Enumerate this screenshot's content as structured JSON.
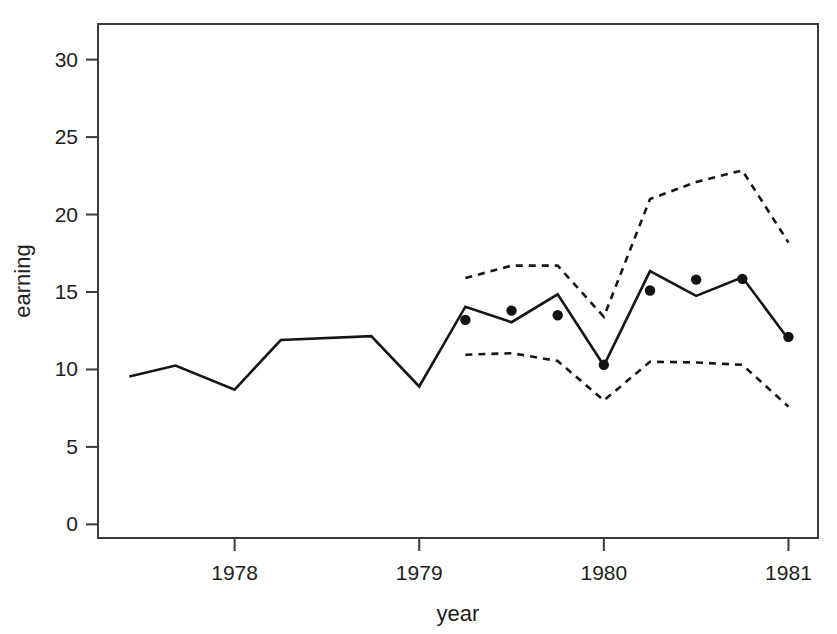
{
  "chart_data": {
    "type": "line",
    "title": "",
    "xlabel": "year",
    "ylabel": "earning",
    "xlim": [
      1977.26,
      1981.16
    ],
    "ylim": [
      -0.88,
      32.3
    ],
    "xticks": [
      1978,
      1979,
      1980,
      1981
    ],
    "xtick_labels": [
      "1978",
      "1979",
      "1980",
      "1981"
    ],
    "yticks": [
      0,
      5,
      10,
      15,
      20,
      25,
      30
    ],
    "ytick_labels": [
      "0",
      "5",
      "10",
      "15",
      "20",
      "25",
      "30"
    ],
    "grid": false,
    "legend": "none",
    "box": true,
    "series": [
      {
        "name": "fitted",
        "style": "solid-line",
        "x": [
          1977.43,
          1977.68,
          1978.0,
          1978.25,
          1978.74,
          1979.0,
          1979.25,
          1979.5,
          1979.75,
          1980.0,
          1980.25,
          1980.5,
          1980.75,
          1981.0
        ],
        "values": [
          9.55,
          10.25,
          8.7,
          11.9,
          12.15,
          8.9,
          14.05,
          13.05,
          14.85,
          10.25,
          16.35,
          14.75,
          15.95,
          11.95
        ]
      },
      {
        "name": "upper-bound",
        "style": "dashed-line",
        "x": [
          1979.25,
          1979.5,
          1979.75,
          1980.0,
          1980.25,
          1980.5,
          1980.75,
          1981.0
        ],
        "values": [
          15.9,
          16.7,
          16.7,
          13.4,
          21.0,
          22.1,
          22.85,
          18.2
        ]
      },
      {
        "name": "lower-bound",
        "style": "dashed-line",
        "x": [
          1979.25,
          1979.5,
          1979.75,
          1980.0,
          1980.25,
          1980.5,
          1980.75,
          1981.0
        ],
        "values": [
          10.95,
          11.05,
          10.55,
          8.0,
          10.5,
          10.45,
          10.3,
          7.6
        ]
      },
      {
        "name": "observed",
        "style": "points",
        "x": [
          1979.25,
          1979.5,
          1979.75,
          1980.0,
          1980.25,
          1980.5,
          1980.75,
          1981.0
        ],
        "values": [
          13.2,
          13.8,
          13.5,
          10.3,
          15.1,
          15.8,
          15.85,
          12.1
        ]
      }
    ],
    "colors": {
      "line": "#161616",
      "point": "#121212",
      "axis": "#3a3a3a",
      "background": "#ffffff"
    }
  },
  "figure": {
    "width": 837,
    "height": 634
  }
}
